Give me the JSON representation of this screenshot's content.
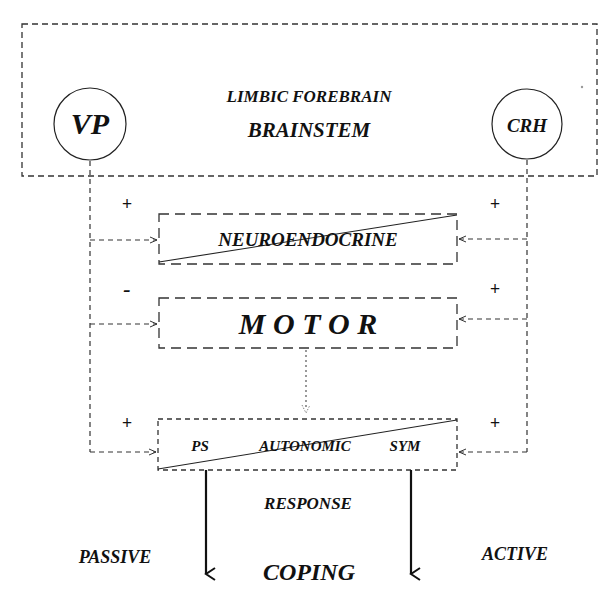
{
  "diagram": {
    "outer_box": {
      "line1": "LIMBIC FOREBRAIN",
      "line2": "BRAINSTEM"
    },
    "nodes": {
      "left_circle": "VP",
      "right_circle": "CRH"
    },
    "boxes": {
      "neuroendocrine": "NEUROENDOCRINE",
      "motor": "M O T O R",
      "autonomic": {
        "left": "PS",
        "center": "AUTONOMIC",
        "right": "SYM"
      }
    },
    "signs": {
      "vp_neuroendocrine": "+",
      "vp_motor": "-",
      "vp_autonomic": "+",
      "crh_neuroendocrine": "+",
      "crh_motor": "+",
      "crh_autonomic": "+"
    },
    "response_label": "RESPONSE",
    "coping": {
      "left": "PASSIVE",
      "center": "COPING",
      "right": "ACTIVE"
    }
  }
}
